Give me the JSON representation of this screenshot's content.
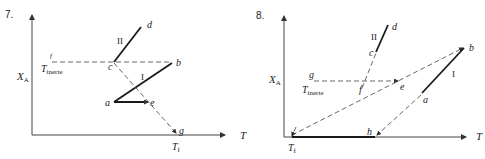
{
  "diagrams": [
    {
      "number": "7.",
      "y_axis_label": "X",
      "y_axis_sub": "A",
      "x_axis_label": "T",
      "inert_label": "T",
      "inert_sub": "inerte",
      "final_label": "T",
      "final_sub": "f",
      "points": {
        "a": "a",
        "b": "b",
        "c": "c",
        "d": "d",
        "e": "e",
        "f": "f",
        "g": "g"
      },
      "segments": {
        "I": "I",
        "II": "II"
      }
    },
    {
      "number": "8.",
      "y_axis_label": "X",
      "y_axis_sub": "A",
      "x_axis_label": "T",
      "inert_label": "T",
      "inert_sub": "inerte",
      "final_label": "T",
      "final_sub": "f",
      "points": {
        "a": "a",
        "b": "b",
        "c": "c",
        "d": "d",
        "e": "e",
        "f": "f",
        "g": "g",
        "h": "h"
      },
      "segments": {
        "I": "I",
        "II": "II"
      }
    }
  ]
}
